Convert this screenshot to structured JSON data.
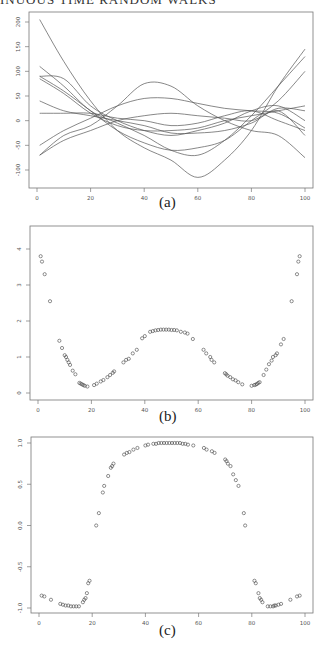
{
  "header": {
    "running_title": "INUOUS TIME RANDOM WALKS"
  },
  "chart_data": [
    {
      "id": "a",
      "type": "line",
      "caption": "(a)",
      "title": "",
      "xlabel": "",
      "ylabel": "",
      "xlim": [
        0,
        100
      ],
      "ylim": [
        -120,
        210
      ],
      "xticks": [
        0,
        20,
        40,
        60,
        80,
        100
      ],
      "yticks": [
        -100,
        -50,
        0,
        50,
        100,
        150,
        200
      ],
      "grid": false,
      "legend": null,
      "x": [
        1,
        10,
        20,
        30,
        40,
        50,
        60,
        70,
        80,
        90,
        100
      ],
      "series": [
        {
          "name": "path1",
          "values": [
            205,
            120,
            40,
            -20,
            -55,
            -80,
            -115,
            -80,
            -20,
            70,
            145
          ]
        },
        {
          "name": "path2",
          "values": [
            110,
            70,
            20,
            -5,
            -30,
            -60,
            -70,
            -40,
            10,
            70,
            130
          ]
        },
        {
          "name": "path3",
          "values": [
            90,
            60,
            20,
            -20,
            -45,
            -60,
            -55,
            -40,
            0,
            40,
            100
          ]
        },
        {
          "name": "path4",
          "values": [
            90,
            85,
            30,
            0,
            -20,
            -30,
            -20,
            -5,
            20,
            30,
            0
          ]
        },
        {
          "name": "path5",
          "values": [
            85,
            55,
            15,
            -10,
            -20,
            -20,
            -15,
            0,
            10,
            20,
            30
          ]
        },
        {
          "name": "path6",
          "values": [
            40,
            20,
            10,
            0,
            -10,
            -25,
            -25,
            -20,
            -5,
            20,
            -30
          ]
        },
        {
          "name": "path7",
          "values": [
            15,
            15,
            15,
            5,
            0,
            -10,
            -5,
            10,
            20,
            0,
            -20
          ]
        },
        {
          "name": "path8",
          "values": [
            -50,
            -20,
            5,
            30,
            45,
            45,
            35,
            25,
            20,
            15,
            -15
          ]
        },
        {
          "name": "path9",
          "values": [
            -70,
            -30,
            -10,
            30,
            75,
            70,
            30,
            0,
            -20,
            -30,
            -75
          ]
        },
        {
          "name": "path10",
          "values": [
            -70,
            -40,
            -20,
            0,
            10,
            15,
            10,
            5,
            0,
            25,
            20
          ]
        }
      ]
    },
    {
      "id": "b",
      "type": "scatter",
      "caption": "(b)",
      "title": "",
      "xlabel": "",
      "ylabel": "",
      "xlim": [
        0,
        100
      ],
      "ylim": [
        -0.1,
        4.2
      ],
      "xticks": [
        0,
        20,
        40,
        60,
        80,
        100
      ],
      "yticks": [
        0,
        1,
        2,
        3,
        4
      ],
      "grid": false,
      "legend": null,
      "marker": "open-circle",
      "points": [
        [
          1,
          3.8
        ],
        [
          1.5,
          3.65
        ],
        [
          2.5,
          3.3
        ],
        [
          4.5,
          2.55
        ],
        [
          8,
          1.45
        ],
        [
          9,
          1.25
        ],
        [
          10,
          1.05
        ],
        [
          10.5,
          1.0
        ],
        [
          11,
          0.92
        ],
        [
          11.5,
          0.85
        ],
        [
          12,
          0.78
        ],
        [
          13,
          0.62
        ],
        [
          14,
          0.52
        ],
        [
          15.5,
          0.28
        ],
        [
          16,
          0.26
        ],
        [
          16.5,
          0.24
        ],
        [
          17,
          0.22
        ],
        [
          17.5,
          0.2
        ],
        [
          18.5,
          0.18
        ],
        [
          21,
          0.22
        ],
        [
          22,
          0.26
        ],
        [
          23.5,
          0.32
        ],
        [
          24.5,
          0.36
        ],
        [
          26,
          0.44
        ],
        [
          27,
          0.5
        ],
        [
          28,
          0.56
        ],
        [
          28.5,
          0.6
        ],
        [
          32,
          0.85
        ],
        [
          33,
          0.92
        ],
        [
          34,
          0.95
        ],
        [
          35.5,
          1.1
        ],
        [
          37,
          1.2
        ],
        [
          39,
          1.52
        ],
        [
          40,
          1.58
        ],
        [
          42,
          1.7
        ],
        [
          43,
          1.72
        ],
        [
          44,
          1.74
        ],
        [
          45,
          1.75
        ],
        [
          46,
          1.76
        ],
        [
          47,
          1.76
        ],
        [
          48,
          1.76
        ],
        [
          49,
          1.76
        ],
        [
          50,
          1.75
        ],
        [
          51,
          1.75
        ],
        [
          52,
          1.74
        ],
        [
          53.5,
          1.7
        ],
        [
          55,
          1.68
        ],
        [
          56,
          1.65
        ],
        [
          58,
          1.5
        ],
        [
          62,
          1.2
        ],
        [
          63,
          1.1
        ],
        [
          64.5,
          1.0
        ],
        [
          65,
          0.92
        ],
        [
          66,
          0.85
        ],
        [
          70,
          0.55
        ],
        [
          70.5,
          0.52
        ],
        [
          71,
          0.48
        ],
        [
          72,
          0.44
        ],
        [
          73,
          0.38
        ],
        [
          74,
          0.35
        ],
        [
          75,
          0.3
        ],
        [
          76.5,
          0.24
        ],
        [
          80,
          0.2
        ],
        [
          81,
          0.22
        ],
        [
          81.5,
          0.23
        ],
        [
          82,
          0.25
        ],
        [
          82.5,
          0.28
        ],
        [
          83,
          0.3
        ],
        [
          84.5,
          0.5
        ],
        [
          85.5,
          0.65
        ],
        [
          86.5,
          0.8
        ],
        [
          87.5,
          0.9
        ],
        [
          88,
          1.0
        ],
        [
          89,
          1.05
        ],
        [
          89.5,
          1.1
        ],
        [
          91,
          1.35
        ],
        [
          92,
          1.5
        ],
        [
          95,
          2.55
        ],
        [
          97,
          3.3
        ],
        [
          97.5,
          3.65
        ],
        [
          98,
          3.8
        ]
      ]
    },
    {
      "id": "c",
      "type": "scatter",
      "caption": "(c)",
      "title": "",
      "xlabel": "",
      "ylabel": "",
      "xlim": [
        0,
        100
      ],
      "ylim": [
        -1.05,
        1.05
      ],
      "xticks": [
        0,
        20,
        40,
        60,
        80,
        100
      ],
      "yticks": [
        -1.0,
        -0.5,
        0.0,
        0.5,
        1.0
      ],
      "grid": false,
      "legend": null,
      "marker": "open-circle",
      "points": [
        [
          1,
          -0.85
        ],
        [
          2,
          -0.86
        ],
        [
          4.5,
          -0.9
        ],
        [
          8,
          -0.95
        ],
        [
          9,
          -0.96
        ],
        [
          10,
          -0.97
        ],
        [
          11,
          -0.97
        ],
        [
          12,
          -0.98
        ],
        [
          13,
          -0.98
        ],
        [
          14,
          -0.98
        ],
        [
          15,
          -0.98
        ],
        [
          16.5,
          -0.93
        ],
        [
          17,
          -0.9
        ],
        [
          17.5,
          -0.88
        ],
        [
          18,
          -0.82
        ],
        [
          18.5,
          -0.7
        ],
        [
          19,
          -0.67
        ],
        [
          21.5,
          0.0
        ],
        [
          22.5,
          0.15
        ],
        [
          24,
          0.4
        ],
        [
          24.5,
          0.48
        ],
        [
          26,
          0.6
        ],
        [
          27,
          0.7
        ],
        [
          27.5,
          0.72
        ],
        [
          28,
          0.75
        ],
        [
          32,
          0.86
        ],
        [
          33,
          0.88
        ],
        [
          34,
          0.89
        ],
        [
          35.5,
          0.92
        ],
        [
          37,
          0.94
        ],
        [
          40,
          0.97
        ],
        [
          41,
          0.98
        ],
        [
          43,
          0.99
        ],
        [
          44,
          0.99
        ],
        [
          45,
          1.0
        ],
        [
          46,
          1.0
        ],
        [
          47,
          1.0
        ],
        [
          48,
          1.0
        ],
        [
          49,
          1.0
        ],
        [
          50,
          1.0
        ],
        [
          51,
          1.0
        ],
        [
          52,
          1.0
        ],
        [
          53,
          1.0
        ],
        [
          54,
          0.99
        ],
        [
          55,
          0.99
        ],
        [
          56,
          0.98
        ],
        [
          58,
          0.97
        ],
        [
          62,
          0.94
        ],
        [
          63,
          0.92
        ],
        [
          65,
          0.9
        ],
        [
          66,
          0.88
        ],
        [
          70,
          0.8
        ],
        [
          70.5,
          0.78
        ],
        [
          71,
          0.75
        ],
        [
          72,
          0.72
        ],
        [
          73,
          0.62
        ],
        [
          74,
          0.55
        ],
        [
          75,
          0.48
        ],
        [
          77,
          0.15
        ],
        [
          77.5,
          0.0
        ],
        [
          81,
          -0.67
        ],
        [
          81.5,
          -0.7
        ],
        [
          82.5,
          -0.82
        ],
        [
          83,
          -0.88
        ],
        [
          83.5,
          -0.9
        ],
        [
          84,
          -0.93
        ],
        [
          86,
          -0.98
        ],
        [
          87,
          -0.98
        ],
        [
          88,
          -0.98
        ],
        [
          88.5,
          -0.97
        ],
        [
          89,
          -0.97
        ],
        [
          90,
          -0.96
        ],
        [
          91,
          -0.95
        ],
        [
          94.5,
          -0.9
        ],
        [
          97,
          -0.86
        ],
        [
          98,
          -0.85
        ]
      ]
    }
  ]
}
